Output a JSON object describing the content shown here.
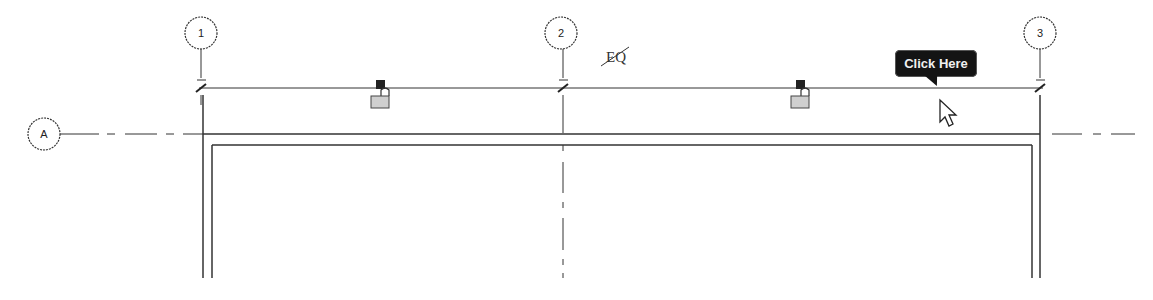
{
  "view": {
    "type": "revit-plan-view",
    "background": "#ffffff",
    "line_color": "#2a2a2a"
  },
  "grids": {
    "vertical": [
      {
        "label": "1",
        "x": 201
      },
      {
        "label": "2",
        "x": 561
      },
      {
        "label": "3",
        "x": 1040
      }
    ],
    "horizontal": [
      {
        "label": "A",
        "y": 134
      }
    ]
  },
  "dimension": {
    "equality_label": "EQ",
    "from_grid": "1",
    "to_grid": "3",
    "lock_icons": [
      {
        "name": "lock-icon-left",
        "state": "unlocked"
      },
      {
        "name": "lock-icon-right",
        "state": "unlocked"
      }
    ]
  },
  "tooltip": {
    "label": "Click Here",
    "background": "#141414",
    "text_color": "#f0f0f0"
  },
  "cursor": {
    "icon": "arrow-pointer-icon"
  }
}
